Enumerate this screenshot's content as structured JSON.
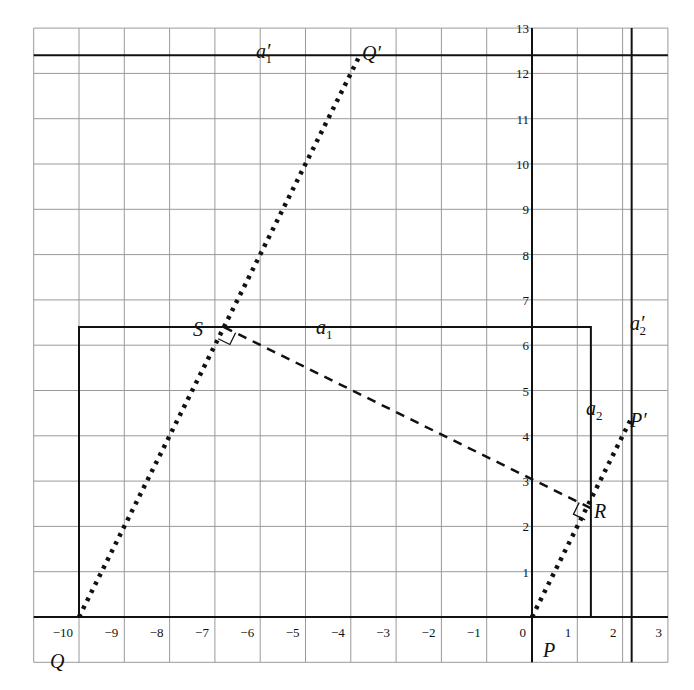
{
  "diagram": {
    "type": "coordinate-geometry",
    "grid": {
      "x_range": [
        -11,
        3
      ],
      "y_range": [
        -1,
        13
      ],
      "cell_size": 1,
      "color": "#9a9a9a"
    },
    "axes": {
      "x_ticks": [
        "−10",
        "−9",
        "−8",
        "−7",
        "−6",
        "−5",
        "−4",
        "−3",
        "−2",
        "−1",
        "0",
        "1",
        "2",
        "3"
      ],
      "y_ticks": [
        "1",
        "2",
        "3",
        "4",
        "5",
        "6",
        "7",
        "8",
        "9",
        "10",
        "11",
        "12",
        "13"
      ]
    },
    "points": {
      "Q": {
        "label": "Q",
        "prime": "",
        "x": -10,
        "y": 0
      },
      "S": {
        "label": "S",
        "prime": "",
        "x": -6.8,
        "y": 6.4
      },
      "Qp": {
        "label": "Q",
        "prime": "′",
        "x": -3.8,
        "y": 12.4
      },
      "P": {
        "label": "P",
        "prime": "",
        "x": 0,
        "y": 0
      },
      "R": {
        "label": "R",
        "prime": "",
        "x": 1.3,
        "y": 2.4
      },
      "Pp": {
        "label": "P",
        "prime": "′",
        "x": 2.2,
        "y": 4.4
      }
    },
    "lines": {
      "a1": {
        "label": "a",
        "sub": "1",
        "prime": "",
        "kind": "horizontal",
        "value": 6.4
      },
      "a2": {
        "label": "a",
        "sub": "2",
        "prime": "",
        "kind": "vertical",
        "value": 1.3
      },
      "a1p": {
        "label": "a",
        "sub": "1",
        "prime": "′",
        "kind": "horizontal",
        "value": 12.4
      },
      "a2p": {
        "label": "a",
        "sub": "2",
        "prime": "′",
        "kind": "vertical",
        "value": 2.2
      }
    },
    "segments": [
      {
        "from": "Q",
        "to": "Qp",
        "style": "dotted"
      },
      {
        "from": "P",
        "to": "Pp",
        "style": "dotted"
      },
      {
        "from": "S",
        "to": "R",
        "style": "dashed"
      }
    ],
    "right_angle_markers": [
      "S",
      "R"
    ],
    "rectangle": {
      "x_min": -10,
      "x_max": 1.3,
      "y_min": 0,
      "y_max": 6.4
    }
  }
}
